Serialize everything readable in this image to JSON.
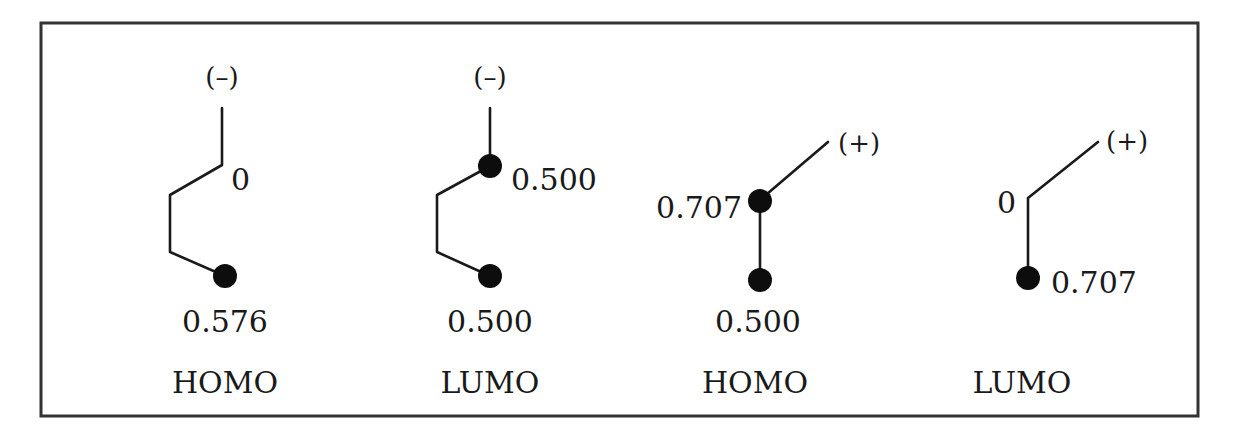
{
  "frame": {
    "border_color": "#333333"
  },
  "diagrams": [
    {
      "orbital": "HOMO",
      "terminal_sign": "(–)",
      "coefficients": {
        "upper": "0",
        "lower": "0.576"
      }
    },
    {
      "orbital": "LUMO",
      "terminal_sign": "(–)",
      "coefficients": {
        "upper": "0.500",
        "lower": "0.500"
      }
    },
    {
      "orbital": "HOMO",
      "terminal_sign": "(+)",
      "coefficients": {
        "upper": "0.707",
        "lower": "0.500"
      }
    },
    {
      "orbital": "LUMO",
      "terminal_sign": "(+)",
      "coefficients": {
        "upper": "0",
        "lower": "0.707"
      }
    }
  ]
}
